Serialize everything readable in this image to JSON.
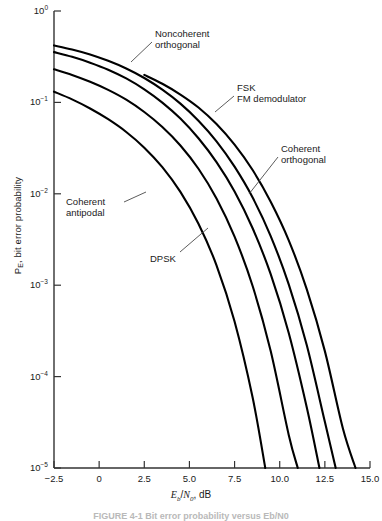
{
  "figure": {
    "caption": "FIGURE 4-1  Bit error probability versus Eb/N0",
    "background": "#ffffff",
    "line_color": "#000000",
    "axis_color": "#333333",
    "text_color": "#1a1a1a"
  },
  "chart_data": {
    "type": "line",
    "title": "",
    "subtitle": "",
    "xlabel": "Eb/N0, dB",
    "ylabel": "PE, bit error probability",
    "xscale": "linear",
    "yscale": "log",
    "xlim": [
      -2.5,
      15.0
    ],
    "ylim": [
      1e-05,
      1
    ],
    "grid": false,
    "legend_position": "inline-annotations",
    "xticks": [
      -2.5,
      0,
      2.5,
      5.0,
      7.5,
      10.0,
      12.5,
      15.0
    ],
    "xticklabels": [
      "−2.5",
      "0",
      "2.5",
      "5.0",
      "7.5",
      "10.0",
      "12.5",
      "15.0"
    ],
    "yticks": [
      1,
      0.1,
      0.01,
      0.001,
      0.0001,
      1e-05
    ],
    "yticklabels": [
      "10",
      "10",
      "10",
      "10",
      "10",
      "10"
    ],
    "yticks_exponents": [
      "0",
      "-1",
      "-2",
      "-3",
      "-4",
      "-5"
    ],
    "annotations": [
      {
        "name": "noncoherent-orthogonal",
        "lines": [
          "Noncoherent",
          "orthogonal"
        ],
        "x": 155,
        "y": 28,
        "leader": [
          [
            152,
            42
          ],
          [
            131,
            62
          ]
        ]
      },
      {
        "name": "fsk-fm-demodulator",
        "lines": [
          "FSK",
          "FM demodulator"
        ],
        "x": 237,
        "y": 82,
        "leader": [
          [
            234,
            96
          ],
          [
            215,
            112
          ]
        ]
      },
      {
        "name": "coherent-orthogonal",
        "lines": [
          "Coherent",
          "orthogonal"
        ],
        "x": 281,
        "y": 143,
        "leader": [
          [
            278,
            157
          ],
          [
            249,
            194
          ]
        ]
      },
      {
        "name": "coherent-antipodal",
        "lines": [
          "Coherent",
          "antipodal"
        ],
        "x": 66,
        "y": 196,
        "leader": [
          [
            124,
            202
          ],
          [
            146,
            192
          ]
        ]
      },
      {
        "name": "dpsk",
        "lines": [
          "DPSK"
        ],
        "x": 150,
        "y": 253,
        "leader": [
          [
            180,
            252
          ],
          [
            208,
            228
          ]
        ]
      }
    ],
    "series": [
      {
        "name": "Noncoherent orthogonal",
        "points": [
          [
            -2.5,
            0.42
          ],
          [
            -1.5,
            0.38
          ],
          [
            -0.5,
            0.335
          ],
          [
            0.5,
            0.285
          ],
          [
            1.5,
            0.235
          ],
          [
            2.5,
            0.185
          ],
          [
            3.5,
            0.138
          ],
          [
            4.5,
            0.097
          ],
          [
            5.5,
            0.063
          ],
          [
            6.5,
            0.0375
          ],
          [
            7.5,
            0.0198
          ],
          [
            8.5,
            0.0091
          ],
          [
            9.5,
            0.00345
          ],
          [
            10.5,
            0.00102
          ],
          [
            11.5,
            0.00022
          ],
          [
            12.5,
            3.2e-05
          ],
          [
            13.1,
            1e-05
          ]
        ]
      },
      {
        "name": "DPSK",
        "points": [
          [
            -2.5,
            0.355
          ],
          [
            -1.5,
            0.315
          ],
          [
            -0.5,
            0.272
          ],
          [
            0.5,
            0.228
          ],
          [
            1.5,
            0.183
          ],
          [
            2.5,
            0.139
          ],
          [
            3.5,
            0.0995
          ],
          [
            4.5,
            0.0665
          ],
          [
            5.5,
            0.0405
          ],
          [
            6.5,
            0.0222
          ],
          [
            7.5,
            0.0106
          ],
          [
            8.5,
            0.0042
          ],
          [
            9.5,
            0.00132
          ],
          [
            10.5,
            0.0003
          ],
          [
            11.5,
            4.6e-05
          ],
          [
            12.2,
            1e-05
          ]
        ]
      },
      {
        "name": "FSK FM demodulator",
        "points": [
          [
            2.5,
            0.2
          ],
          [
            3.5,
            0.16
          ],
          [
            4.5,
            0.122
          ],
          [
            5.5,
            0.088
          ],
          [
            6.5,
            0.058
          ],
          [
            7.5,
            0.0345
          ],
          [
            8.5,
            0.0182
          ],
          [
            9.5,
            0.0082
          ],
          [
            10.5,
            0.0031
          ],
          [
            11.5,
            0.0009
          ],
          [
            12.5,
            0.00019
          ],
          [
            13.5,
            2.7e-05
          ],
          [
            14.2,
            1e-05
          ]
        ]
      },
      {
        "name": "Coherent orthogonal",
        "points": [
          [
            -2.5,
            0.23
          ],
          [
            -1.5,
            0.2
          ],
          [
            -0.5,
            0.168
          ],
          [
            0.5,
            0.137
          ],
          [
            1.5,
            0.107
          ],
          [
            2.5,
            0.0785
          ],
          [
            3.5,
            0.0538
          ],
          [
            4.5,
            0.0338
          ],
          [
            5.5,
            0.0188
          ],
          [
            6.5,
            0.0089
          ],
          [
            7.5,
            0.0034
          ],
          [
            8.5,
            0.00098
          ],
          [
            9.5,
            0.00019
          ],
          [
            10.5,
            2.3e-05
          ],
          [
            11.0,
            1e-05
          ]
        ]
      },
      {
        "name": "Coherent antipodal",
        "points": [
          [
            -2.5,
            0.131
          ],
          [
            -1.5,
            0.108
          ],
          [
            -0.5,
            0.0858
          ],
          [
            0.5,
            0.0655
          ],
          [
            1.5,
            0.0475
          ],
          [
            2.5,
            0.032
          ],
          [
            3.5,
            0.0196
          ],
          [
            4.5,
            0.0105
          ],
          [
            5.5,
            0.0047
          ],
          [
            6.5,
            0.00165
          ],
          [
            7.5,
            0.0004
          ],
          [
            8.5,
            5.9e-05
          ],
          [
            9.2,
            1e-05
          ]
        ]
      }
    ]
  }
}
